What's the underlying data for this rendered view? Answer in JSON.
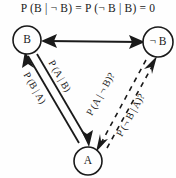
{
  "figure": {
    "title": "P (B | ¬ B) = P (¬ B | B) = 0",
    "nodes": [
      {
        "id": "B",
        "label": "B",
        "cx": 27,
        "cy": 40,
        "r": 14
      },
      {
        "id": "notB",
        "label": "¬ B",
        "cx": 158,
        "cy": 42,
        "r": 15
      },
      {
        "id": "A",
        "label": "A",
        "cx": 88,
        "cy": 161,
        "r": 14
      }
    ],
    "edges": [
      {
        "id": "b-notb",
        "from": "B",
        "to": "notB",
        "style": "solid",
        "arrows": "both",
        "label": ""
      },
      {
        "id": "b-a-out",
        "from": "B",
        "to": "A",
        "style": "solid",
        "arrows": "end",
        "label": "P (A | B)"
      },
      {
        "id": "a-b-back",
        "from": "A",
        "to": "B",
        "style": "solid",
        "arrows": "end",
        "label": "P (B | A)"
      },
      {
        "id": "a-notb-1",
        "from": "notB",
        "to": "A",
        "style": "dashed",
        "arrows": "end",
        "label": "P (A | ¬ B)?"
      },
      {
        "id": "a-notb-2",
        "from": "A",
        "to": "notB",
        "style": "dashed",
        "arrows": "end",
        "label": "P (¬ B | A)?"
      }
    ],
    "labels": {
      "p_a_given_b": "P (A | B)",
      "p_b_given_a": "P (B | A)",
      "p_a_given_notb": "P (A | ¬ B)?",
      "p_notb_given_a": "P (¬ B | A)?"
    },
    "colors": {
      "ink": "#1a1a1a",
      "background": "#fefefe"
    }
  }
}
